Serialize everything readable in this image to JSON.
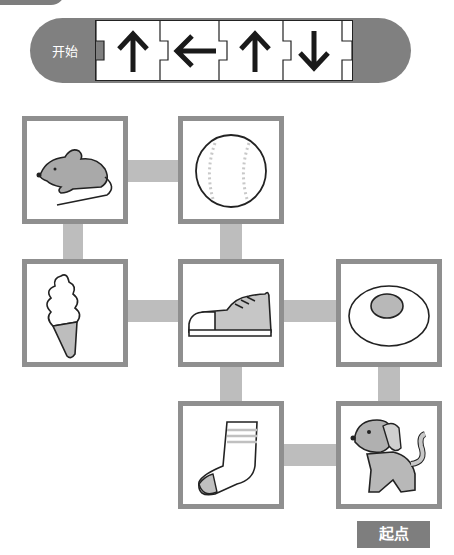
{
  "header": {
    "start_label": "开始",
    "sequence": [
      {
        "direction": "up",
        "icon": "arrow-up-icon"
      },
      {
        "direction": "left",
        "icon": "arrow-left-icon"
      },
      {
        "direction": "up",
        "icon": "arrow-up-icon"
      },
      {
        "direction": "down",
        "icon": "arrow-down-icon"
      }
    ]
  },
  "grid": {
    "cells": [
      {
        "row": 1,
        "col": 1,
        "item": "mouse",
        "icon": "mouse-icon"
      },
      {
        "row": 1,
        "col": 2,
        "item": "baseball",
        "icon": "baseball-icon"
      },
      {
        "row": 2,
        "col": 1,
        "item": "ice-cream",
        "icon": "ice-cream-icon"
      },
      {
        "row": 2,
        "col": 2,
        "item": "sneaker",
        "icon": "sneaker-icon"
      },
      {
        "row": 2,
        "col": 3,
        "item": "fried-egg",
        "icon": "fried-egg-icon"
      },
      {
        "row": 3,
        "col": 2,
        "item": "sock",
        "icon": "sock-icon"
      },
      {
        "row": 3,
        "col": 3,
        "item": "robot-dog",
        "icon": "robot-dog-icon"
      }
    ],
    "connections": [
      [
        "mouse",
        "baseball"
      ],
      [
        "mouse",
        "ice-cream"
      ],
      [
        "baseball",
        "sneaker"
      ],
      [
        "ice-cream",
        "sneaker"
      ],
      [
        "sneaker",
        "fried-egg"
      ],
      [
        "sneaker",
        "sock"
      ],
      [
        "fried-egg",
        "robot-dog"
      ],
      [
        "sock",
        "robot-dog"
      ]
    ]
  },
  "footer": {
    "start_point_label": "起点"
  },
  "colors": {
    "pill": "#808080",
    "box_border": "#8f8f8f",
    "connector": "#bdbdbd",
    "tag": "#7e7e7e"
  }
}
